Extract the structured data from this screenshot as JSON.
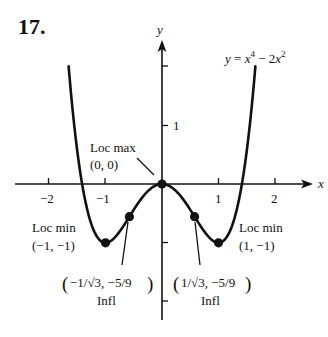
{
  "problem_number": "17.",
  "equation": {
    "lhs": "y",
    "eq": " = ",
    "x4": "x",
    "exp4": "4",
    "minus": " − 2",
    "x2": "x",
    "exp2": "2"
  },
  "axes": {
    "x_label": "x",
    "y_label": "y",
    "x_ticks": [
      "−2",
      "−1",
      "1",
      "2"
    ],
    "y_ticks": [
      "1"
    ]
  },
  "annotations": {
    "loc_max": {
      "title": "Loc max",
      "coords": "(0, 0)"
    },
    "loc_min_left": {
      "title": "Loc min",
      "coords": "(−1, −1)"
    },
    "loc_min_right": {
      "title": "Loc min",
      "coords": "(1, −1)"
    },
    "infl_left": {
      "coords": "−1/√3, −5/9",
      "title": "Infl"
    },
    "infl_right": {
      "coords": "1/√3, −5/9",
      "title": "Infl"
    }
  },
  "colors": {
    "ink": "#111111",
    "background": "#ffffff"
  },
  "chart_data": {
    "type": "line",
    "xlabel": "x",
    "ylabel": "y",
    "xlim": [
      -2.6,
      2.8
    ],
    "ylim": [
      -2.3,
      2.3
    ],
    "x_ticks": [
      -2,
      -1,
      1,
      2
    ],
    "y_ticks": [
      -2,
      -1,
      1,
      2
    ],
    "y_tick_labels_shown": [
      1
    ],
    "grid": false,
    "series": [
      {
        "name": "y = x^4 - 2x^2",
        "x": [
          -1.65,
          -1.5,
          -1.414,
          -1.25,
          -1.0,
          -0.75,
          -0.577,
          -0.5,
          -0.25,
          0,
          0.25,
          0.5,
          0.577,
          0.75,
          1.0,
          1.25,
          1.414,
          1.5,
          1.65
        ],
        "y": [
          2.0,
          0.5625,
          0,
          -0.684,
          -1.0,
          -0.809,
          -0.556,
          -0.4375,
          -0.121,
          0,
          -0.121,
          -0.4375,
          -0.556,
          -0.809,
          -1.0,
          -0.684,
          0,
          0.5625,
          2.0
        ]
      }
    ],
    "points": [
      {
        "label": "Loc max",
        "x": 0,
        "y": 0
      },
      {
        "label": "Loc min",
        "x": -1,
        "y": -1
      },
      {
        "label": "Loc min",
        "x": 1,
        "y": -1
      },
      {
        "label": "Infl",
        "x": -0.577,
        "y": -0.556
      },
      {
        "label": "Infl",
        "x": 0.577,
        "y": -0.556
      }
    ]
  }
}
